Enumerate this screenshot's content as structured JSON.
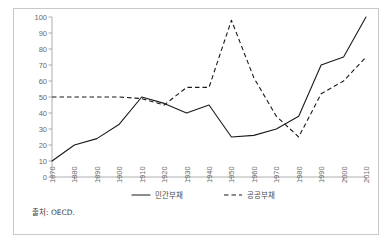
{
  "figure": {
    "source_note": "출처: OECD."
  },
  "chart_data": {
    "type": "line",
    "title": "",
    "xlabel": "",
    "ylabel": "",
    "xlim": [
      1870,
      2010
    ],
    "ylim": [
      0,
      100
    ],
    "ygrid": false,
    "xgrid": false,
    "legend_position": "bottom",
    "yticks": [
      0,
      10,
      20,
      30,
      40,
      50,
      60,
      70,
      80,
      90,
      100
    ],
    "ytick_labels": [
      "0",
      "10",
      "20",
      "30",
      "40",
      "50",
      "60",
      "70",
      "80",
      "90",
      "100"
    ],
    "categories": [
      1870,
      1880,
      1890,
      1900,
      1910,
      1920,
      1930,
      1940,
      1950,
      1960,
      1970,
      1980,
      1990,
      2000,
      2010
    ],
    "xtick_labels": [
      "1870",
      "1880",
      "1890",
      "1900",
      "1910",
      "1920",
      "1930",
      "1940",
      "1950",
      "1960",
      "1970",
      "1980",
      "1990",
      "2000",
      "2010"
    ],
    "series": [
      {
        "name": "민간부채",
        "style": "solid",
        "color": "#1a1a1a",
        "values": [
          10,
          20,
          24,
          33,
          50,
          46,
          40,
          45,
          25,
          26,
          30,
          38,
          70,
          75,
          100
        ]
      },
      {
        "name": "공공부채",
        "style": "dashed",
        "color": "#1a1a1a",
        "values": [
          50,
          50,
          50,
          50,
          49,
          45,
          56,
          56,
          98,
          62,
          38,
          25,
          52,
          60,
          75
        ]
      }
    ]
  },
  "legend": {
    "items": [
      {
        "label": "민간부채",
        "style": "solid"
      },
      {
        "label": "공공부채",
        "style": "dashed"
      }
    ]
  }
}
